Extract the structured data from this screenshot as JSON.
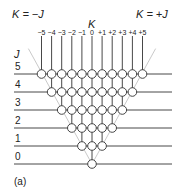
{
  "labels": {
    "k_minus_j": "K = −J",
    "k_plus_j": "K = +J",
    "k_axis": "K",
    "j_axis": "J",
    "panel": "(a)"
  },
  "k_ticks": [
    "−5",
    "−4",
    "−3",
    "−2",
    "−1",
    "0",
    "+1",
    "+2",
    "+3",
    "+4",
    "+5"
  ],
  "j_levels": [
    "5",
    "4",
    "3",
    "2",
    "1",
    "0"
  ],
  "colors": {
    "line": "#333333",
    "diag": "#bbbbbb",
    "node_fill": "#ffffff"
  }
}
